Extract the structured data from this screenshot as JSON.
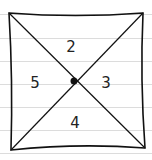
{
  "diagram": {
    "regions": [
      {
        "position": "top",
        "label": "2"
      },
      {
        "position": "right",
        "label": "3"
      },
      {
        "position": "bottom",
        "label": "4"
      },
      {
        "position": "left",
        "label": "5"
      }
    ],
    "center_point": "dot",
    "background": "ruled-paper",
    "line_color": "#111111"
  }
}
